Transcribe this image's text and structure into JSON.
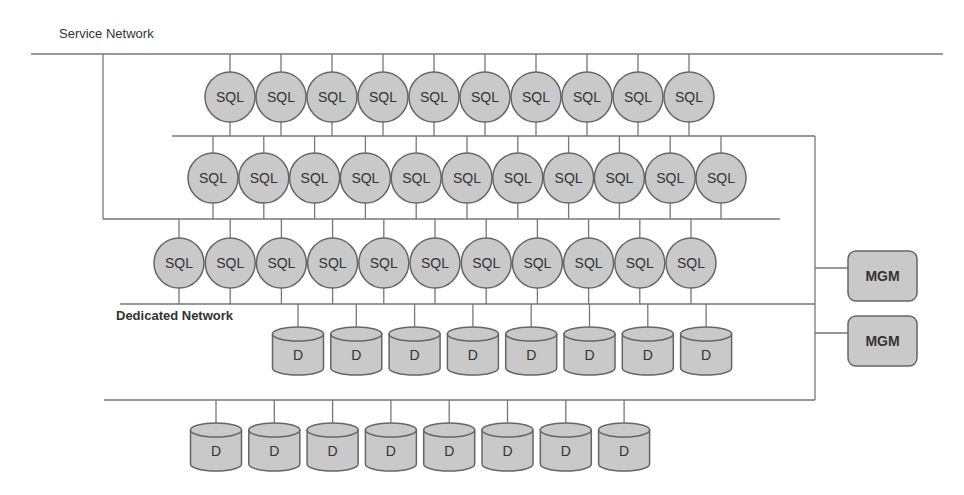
{
  "labels": {
    "service_network": "Service Network",
    "dedicated_network": "Dedicated Network"
  },
  "colors": {
    "node_fill": "#c9c9c9",
    "node_stroke": "#666666",
    "line": "#777777",
    "text": "#333333"
  },
  "sql_rows": [
    {
      "count": 10,
      "start_x": 230,
      "step": 51.0,
      "cy": 97,
      "label": "SQL",
      "top_line_y": 54,
      "bottom_line_y": 136
    },
    {
      "count": 11,
      "start_x": 213,
      "step": 50.8,
      "cy": 178,
      "label": "SQL",
      "top_line_y": 136,
      "bottom_line_y": 219
    },
    {
      "count": 11,
      "start_x": 179,
      "step": 51.2,
      "cy": 263,
      "label": "SQL",
      "top_line_y": 219,
      "bottom_line_y": 304
    }
  ],
  "data_rows": [
    {
      "count": 8,
      "start_x": 298,
      "step": 58.3,
      "top_y": 327,
      "label": "D",
      "line_y": 304
    },
    {
      "count": 8,
      "start_x": 216,
      "step": 58.3,
      "top_y": 423,
      "label": "D",
      "line_y": 400
    }
  ],
  "mgm_nodes": [
    {
      "label": "MGM",
      "x": 848,
      "y": 251,
      "w": 69,
      "h": 50,
      "connector_y": 268
    },
    {
      "label": "MGM",
      "x": 848,
      "y": 316,
      "w": 69,
      "h": 50,
      "connector_y": 333
    }
  ],
  "networks": {
    "service_line": {
      "x1": 31,
      "x2": 943,
      "y": 54
    },
    "left_drop": {
      "x": 103,
      "y1": 54,
      "y2": 219
    },
    "line2": {
      "x1": 172,
      "x2": 815,
      "y": 136
    },
    "line3": {
      "x1": 103,
      "x2": 780,
      "y": 219
    },
    "dedicated_line": {
      "x1": 120,
      "x2": 815,
      "y": 304
    },
    "bottom_line": {
      "x1": 104,
      "x2": 815,
      "y": 400
    },
    "right_vertical": {
      "x": 815,
      "y1": 136,
      "y2": 400
    },
    "mgm_connector_x1": 815
  }
}
